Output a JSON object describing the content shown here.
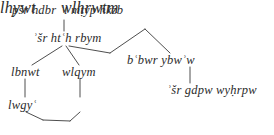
{
  "diagram": {
    "type": "syntax-tree",
    "script": "latin-transliteration-of-hebrew",
    "background_color": "#ffffff",
    "ink_color": "#2b2b2b",
    "nodes": [
      {
        "id": "root",
        "text": "pšr hdbr ʿl mṭyp hkzb",
        "level": 0
      },
      {
        "id": "asher-hith-rabbim",
        "text": "ʾSr htʿh rbym",
        "level": 1
      },
      {
        "id": "babur-yabou",
        "text": "bʿbwr ybwʾw",
        "level": 2
      },
      {
        "id": "lbnwt",
        "text": "lbnwt",
        "level": 2
      },
      {
        "id": "wlqym",
        "text": "wlqym",
        "level": 2
      },
      {
        "id": "asher-gdpw",
        "text": "ʾSr gdpw wyhrpw",
        "level": 3
      },
      {
        "id": "lwgy",
        "text": "lwgyʿ",
        "level": 3
      },
      {
        "id": "wlhrwtm",
        "text": "wlhrwtm",
        "level": 3
      },
      {
        "id": "lhywt",
        "text": "lhywt",
        "level": 4
      }
    ],
    "edges": [
      {
        "from": "root",
        "to": "asher-hith-rabbim"
      },
      {
        "from": "asher-hith-rabbim",
        "to": "lbnwt"
      },
      {
        "from": "asher-hith-rabbim",
        "to": "wlqym"
      },
      {
        "from": "asher-hith-rabbim",
        "to": "babur-yabou"
      },
      {
        "from": "babur-yabou",
        "to": "asher-gdpw"
      },
      {
        "from": "lbnwt",
        "to": "lwgy"
      },
      {
        "from": "wlqym",
        "to": "wlhrwtm"
      },
      {
        "from": "lwgy",
        "to": "lhywt"
      },
      {
        "from": "wlhrwtm",
        "to": "lhywt"
      }
    ]
  },
  "labels": {
    "root": {
      "pre": "pšr hdbr ",
      "sup": "ʿ",
      "post": "l mṭyp hkzb"
    },
    "asher_hith": {
      "pre": "ʾšr ht",
      "sup": "ʿ",
      "post": "h rbym"
    },
    "babur": {
      "pre": "b",
      "sup": "ʿ",
      "post": "bwr ybwʾw"
    },
    "lbnwt": {
      "text": "lbnwt"
    },
    "wlqym": {
      "text": "wlqym"
    },
    "asher_gdpw": {
      "text": "ʾšr gdpw wyḥrpw"
    },
    "lwgy": {
      "pre": "lwgy",
      "sup": "ʿ",
      "post": ""
    },
    "wlhrwtm": {
      "text": "wlhrwtm"
    },
    "lhywt": {
      "text": "lhywt"
    }
  }
}
